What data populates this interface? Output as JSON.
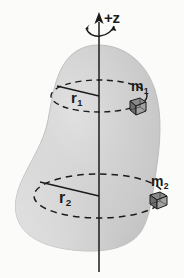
{
  "figure": {
    "background_color": "#fbfbfa",
    "body_fill_color": "#c9c9c9",
    "body_highlight_color": "#e3e3e3",
    "line_color": "#1b1b1b"
  },
  "axis": {
    "label": "+z",
    "name": "z-axis",
    "rotation_indicator": "curved-arrow"
  },
  "radii": [
    {
      "id": "r1",
      "base": "r",
      "subscript": "1",
      "name": "radius-upper"
    },
    {
      "id": "r2",
      "base": "r",
      "subscript": "2",
      "name": "radius-lower"
    }
  ],
  "masses": [
    {
      "id": "m1",
      "base": "m",
      "subscript": "1",
      "name": "mass-upper",
      "shape": "cube"
    },
    {
      "id": "m2",
      "base": "m",
      "subscript": "2",
      "name": "mass-lower",
      "shape": "cube"
    }
  ],
  "orbits": [
    {
      "id": "orbit-upper",
      "style": "dashed",
      "name": "circular-path-upper"
    },
    {
      "id": "orbit-lower",
      "style": "dashed",
      "name": "circular-path-lower"
    }
  ]
}
